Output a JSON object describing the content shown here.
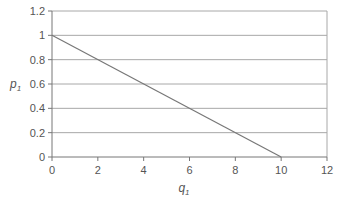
{
  "chart_data": {
    "type": "line",
    "title": "",
    "xlabel": "q1",
    "ylabel": "p1",
    "xlim": [
      0,
      12
    ],
    "ylim": [
      0,
      1.2
    ],
    "grid": "horizontal",
    "legend": null,
    "x_ticks": [
      "0",
      "2",
      "4",
      "6",
      "8",
      "10",
      "12"
    ],
    "y_ticks": [
      "0",
      "0.2",
      "0.4",
      "0.6",
      "0.8",
      "1",
      "1.2"
    ],
    "series": [
      {
        "name": "demand",
        "x": [
          0,
          10
        ],
        "y": [
          1,
          0
        ],
        "color": "#777777"
      }
    ]
  },
  "axes": {
    "xlabel_main": "q",
    "xlabel_sub": "1",
    "ylabel_main": "p",
    "ylabel_sub": "1"
  }
}
